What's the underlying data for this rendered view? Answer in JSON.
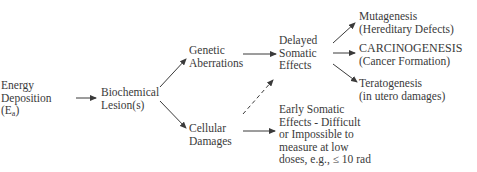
{
  "diagram": {
    "nodes": {
      "energy": {
        "lines": [
          "Energy",
          "Deposition",
          "(E"
        ],
        "subscript": "a",
        "suffix": ")"
      },
      "biochemical": {
        "lines": [
          "Biochemical",
          "Lesion(s)"
        ]
      },
      "genetic": {
        "lines": [
          "Genetic",
          "Aberrations"
        ]
      },
      "cellular": {
        "lines": [
          "Cellular",
          "Damages"
        ]
      },
      "delayed": {
        "lines": [
          "Delayed",
          "Somatic",
          "Effects"
        ]
      },
      "early": {
        "lines": [
          "Early Somatic",
          "Effects - Difficult",
          "or Impossible to",
          "measure at low",
          "doses, e.g., ≤ 10 rad"
        ]
      },
      "mutagenesis": {
        "lines": [
          "Mutagenesis",
          "(Hereditary Defects)"
        ]
      },
      "carcinogenesis": {
        "lines": [
          "CARCINOGENESIS",
          "(Cancer Formation)"
        ]
      },
      "teratogenesis": {
        "lines": [
          "Teratogenesis",
          "(in utero damages)"
        ]
      }
    },
    "edges": [
      {
        "from": "energy",
        "to": "biochemical",
        "style": "solid"
      },
      {
        "from": "biochemical",
        "to": "genetic",
        "style": "solid"
      },
      {
        "from": "biochemical",
        "to": "cellular",
        "style": "solid"
      },
      {
        "from": "genetic",
        "to": "delayed",
        "style": "solid"
      },
      {
        "from": "cellular",
        "to": "delayed",
        "style": "dashed"
      },
      {
        "from": "cellular",
        "to": "early",
        "style": "solid"
      },
      {
        "from": "delayed",
        "to": "mutagenesis",
        "style": "solid"
      },
      {
        "from": "delayed",
        "to": "carcinogenesis",
        "style": "solid"
      },
      {
        "from": "delayed",
        "to": "teratogenesis",
        "style": "solid"
      }
    ],
    "colors": {
      "text": "#3a3a3a",
      "line": "#3a3a3a",
      "background": "#ffffff"
    }
  }
}
